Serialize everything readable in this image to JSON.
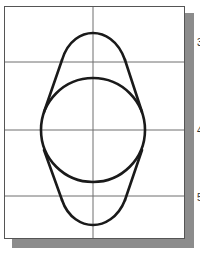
{
  "diagram": {
    "type": "geometric-construction",
    "colors": {
      "background": "#ffffff",
      "frame_border": "#555555",
      "shadow": "#8c8c8c",
      "grid_line": "#6e6e6e",
      "geometry_stroke": "#1a1a1a"
    },
    "grid": {
      "vertical_lines_x": [
        93
      ],
      "horizontal_lines_y": [
        62,
        130,
        196
      ]
    },
    "shapes": {
      "circle": {
        "cx": 93,
        "cy": 130,
        "r": 52
      },
      "upper_arc": {
        "peak": [
          93,
          33
        ],
        "left_end": [
          62,
          60
        ],
        "right_end": [
          125,
          60
        ]
      },
      "lower_arc": {
        "bottom": [
          93,
          225
        ],
        "left_end": [
          62,
          200
        ],
        "right_end": [
          125,
          200
        ]
      },
      "tangent_lines": [
        {
          "from": [
            62,
            60
          ],
          "to": [
            44,
            112
          ]
        },
        {
          "from": [
            125,
            60
          ],
          "to": [
            142,
            112
          ]
        },
        {
          "from": [
            44,
            150
          ],
          "to": [
            62,
            200
          ]
        },
        {
          "from": [
            142,
            150
          ],
          "to": [
            125,
            200
          ]
        }
      ]
    },
    "step_labels": [
      {
        "text": "3",
        "y": 38
      },
      {
        "text": "4",
        "y": 126
      },
      {
        "text": "5",
        "y": 193
      }
    ]
  }
}
